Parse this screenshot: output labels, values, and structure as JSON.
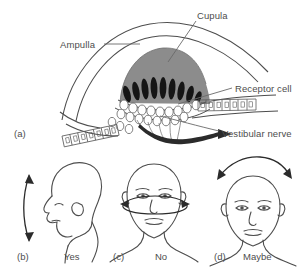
{
  "figure": {
    "background_color": "#ffffff",
    "line_color": "#4d4d4d",
    "cupula_fill": "#8c8c8c",
    "hair_cell_fill": "#1a1a1a",
    "nerve_fill": "#2b2b2b",
    "text_color": "#4d4d4d"
  },
  "panel_a": {
    "tag": "(a)",
    "labels": {
      "cupula": "Cupula",
      "ampulla": "Ampulla",
      "receptor_cell": "Receptor cell",
      "vestibular_nerve": "Vestibular nerve"
    }
  },
  "panel_b": {
    "tag": "(b)",
    "caption": "Yes",
    "head_view": "profile-facing-left",
    "motion": "vertical nodding double arrow"
  },
  "panel_c": {
    "tag": "(c)",
    "caption": "No",
    "head_view": "front-facing",
    "motion": "horizontal elliptical double arrow"
  },
  "panel_d": {
    "tag": "(d)",
    "caption": "Maybe",
    "head_view": "front-facing",
    "motion": "arc double arrow above head"
  }
}
